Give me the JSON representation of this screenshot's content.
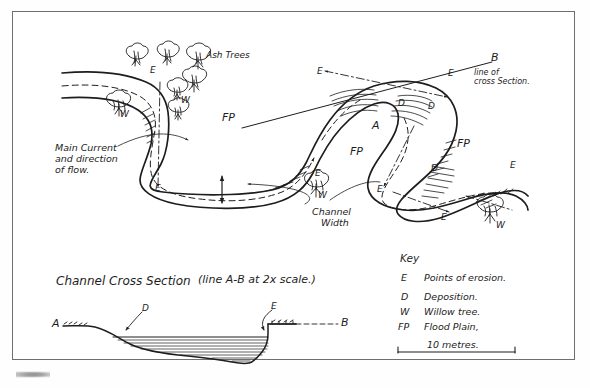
{
  "sheet": {
    "description": "Hand-drawn field sketch of a river meander with channel cross section and key",
    "ink_color": "#1d1d1d",
    "frame_color": "#6f6f6f",
    "paper_color": "#ffffff"
  },
  "map": {
    "labels": {
      "ash_trees": "Ash Trees",
      "main_current": "Main Current\nand direction\nof flow.",
      "channel_width": "Channel\n   Width",
      "point_b": "B",
      "line_of_cross_section": "line of\ncross Section.",
      "point_a": "A"
    },
    "erosion_points": [
      "E",
      "E",
      "E",
      "E",
      "E",
      "E",
      "E",
      "E",
      "E"
    ],
    "deposition_points": [
      "D",
      "D",
      "D",
      "D"
    ],
    "willow_labels": [
      "W",
      "W",
      "W"
    ],
    "floodplain_labels": [
      "FP",
      "FP",
      "FP",
      "FP"
    ],
    "tree_counts": {
      "ash": 4,
      "willow": 4
    }
  },
  "cross_section": {
    "title": "Channel Cross Section",
    "subtitle": "(line A-B at 2x scale.)",
    "start_label": "A",
    "end_label": "B",
    "deposition_label": "D",
    "erosion_label": "E"
  },
  "key": {
    "heading": "Key",
    "items": [
      {
        "symbol": "E",
        "meaning": "Points of erosion."
      },
      {
        "symbol": "D",
        "meaning": "Deposition."
      },
      {
        "symbol": "W",
        "meaning": "Willow tree."
      },
      {
        "symbol": "FP",
        "meaning": "Flood Plain,"
      }
    ],
    "scale_bar": "10 metres."
  }
}
